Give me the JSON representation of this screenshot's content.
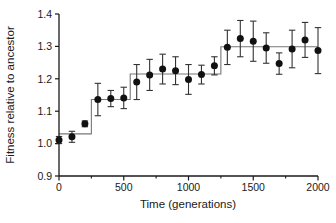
{
  "chart_data": {
    "type": "scatter",
    "title": "",
    "subtitle": "",
    "xlabel": "Time (generations)",
    "ylabel": "Fitness relative to ancestor",
    "xlim": [
      0,
      2000
    ],
    "ylim": [
      0.9,
      1.4
    ],
    "xticks": [
      0,
      500,
      1000,
      1500,
      2000
    ],
    "xticklabels": [
      "0",
      "500",
      "1000",
      "1500",
      "2000"
    ],
    "yticks": [
      0.9,
      1.0,
      1.1,
      1.2,
      1.3,
      1.4
    ],
    "yticklabels": [
      "0.9",
      "1.0",
      "1.1",
      "1.2",
      "1.3",
      "1.4"
    ],
    "minor_xticks": [
      250,
      750,
      1250,
      1750
    ],
    "grid": false,
    "legend": null,
    "marker": "filled-circle",
    "marker_color": "#111111",
    "errorbar_color": "#333333",
    "stepline_color": "#777777",
    "x": [
      0,
      100,
      200,
      300,
      400,
      500,
      600,
      700,
      800,
      900,
      1000,
      1100,
      1200,
      1300,
      1400,
      1500,
      1600,
      1700,
      1800,
      1900,
      2000
    ],
    "values": [
      1.011,
      1.021,
      1.061,
      1.136,
      1.139,
      1.141,
      1.19,
      1.212,
      1.23,
      1.225,
      1.198,
      1.213,
      1.24,
      1.297,
      1.324,
      1.316,
      1.295,
      1.247,
      1.292,
      1.32,
      1.287
    ],
    "err_low": [
      1.0,
      1.004,
      1.052,
      1.086,
      1.114,
      1.108,
      1.136,
      1.164,
      1.184,
      1.182,
      1.152,
      1.184,
      1.212,
      1.244,
      1.268,
      1.254,
      1.248,
      1.214,
      1.234,
      1.266,
      1.216
    ],
    "err_high": [
      1.022,
      1.038,
      1.07,
      1.186,
      1.164,
      1.174,
      1.244,
      1.26,
      1.276,
      1.268,
      1.244,
      1.242,
      1.268,
      1.35,
      1.38,
      1.378,
      1.342,
      1.28,
      1.35,
      1.374,
      1.358
    ],
    "series": [
      {
        "name": "Mean fitness",
        "values": [
          1.011,
          1.021,
          1.061,
          1.136,
          1.139,
          1.141,
          1.19,
          1.212,
          1.23,
          1.225,
          1.198,
          1.213,
          1.24,
          1.297,
          1.324,
          1.316,
          1.295,
          1.247,
          1.292,
          1.32,
          1.287
        ]
      }
    ],
    "step_fit": {
      "name": "Step-function fit",
      "breakpoints": [
        0,
        250,
        550,
        1250,
        2000
      ],
      "levels": [
        1.03,
        1.136,
        1.215,
        1.299
      ]
    }
  }
}
